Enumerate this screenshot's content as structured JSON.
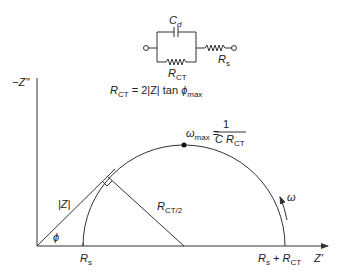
{
  "circuit": {
    "capacitor_label": "C",
    "capacitor_sub": "d",
    "charge_transfer_resistor_label": "R",
    "charge_transfer_resistor_sub": "CT",
    "solution_resistor_label": "R",
    "solution_resistor_sub": "s"
  },
  "equation": {
    "lhs": "R",
    "lhs_sub": "CT",
    "rhs": " = 2|Z| tan ",
    "phi": "ϕ",
    "phi_sub": "max"
  },
  "plot": {
    "y_axis_label": "−Z''",
    "x_axis_label": "Z'",
    "omega_max_label": "ω",
    "omega_max_sub": "max",
    "omega_max_eq": " = ",
    "omega_max_numerator": "1",
    "omega_max_denominator": "C R",
    "omega_max_denominator_sub": "CT",
    "radius_label": "R",
    "radius_sub": "CT/2",
    "impedance_magnitude_label": "|Z|",
    "phase_angle_label": "ϕ",
    "frequency_arrow_label": "ω",
    "x_tick_start": "R",
    "x_tick_start_sub": "s",
    "x_tick_end": "R",
    "x_tick_end_sub": "s",
    "x_tick_end_plus": " + R",
    "x_tick_end_sub2": "CT"
  }
}
